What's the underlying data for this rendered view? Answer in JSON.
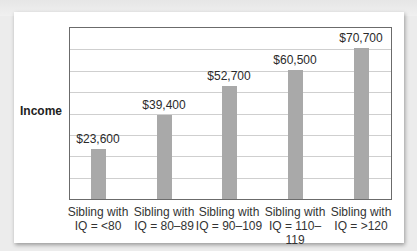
{
  "chart_data": {
    "type": "bar",
    "title": "",
    "xlabel": "",
    "ylabel": "Income",
    "categories": [
      "Sibling with IQ = <80",
      "Sibling with IQ = 80–89",
      "Sibling with IQ = 90–109",
      "Sibling with IQ = 110–119",
      "Sibling with IQ = >120"
    ],
    "values": [
      23600,
      39400,
      52700,
      60500,
      70700
    ],
    "value_labels": [
      "$23,600",
      "$39,400",
      "$52,700",
      "$60,500",
      "$70,700"
    ],
    "ylim": [
      0,
      80000
    ],
    "grid": true,
    "gridlines": 8,
    "legend": null
  },
  "axis": {
    "ylabel": "Income"
  },
  "bars": [
    {
      "label_line1": "Sibling with",
      "label_line2": "IQ = <80",
      "value_label": "$23,600"
    },
    {
      "label_line1": "Sibling with",
      "label_line2": "IQ = 80–89",
      "value_label": "$39,400"
    },
    {
      "label_line1": "Sibling with",
      "label_line2": "IQ = 90–109",
      "value_label": "$52,700"
    },
    {
      "label_line1": "Sibling with",
      "label_line2": "IQ = 110–119",
      "value_label": "$60,500"
    },
    {
      "label_line1": "Sibling with",
      "label_line2": "IQ = >120",
      "value_label": "$70,700"
    }
  ],
  "colors": {
    "bar": "#a9a9a9",
    "grid": "#cfcfcf",
    "frame": "#6b6b6b"
  }
}
